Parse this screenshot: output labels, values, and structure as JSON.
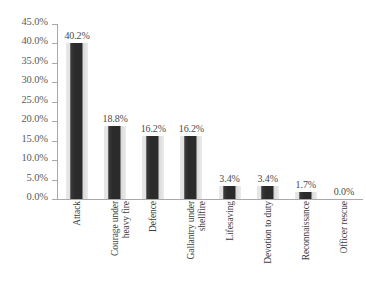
{
  "chart_data": {
    "type": "bar",
    "title": "",
    "subtitle": "",
    "xlabel": "",
    "ylabel": "",
    "categories": [
      "Attack",
      "Courage under\nheavy fire",
      "Defence",
      "Gallantry under\nshellfire",
      "Lifesaving",
      "Devotion to duty",
      "Reconnaissance",
      "Officer rescue"
    ],
    "values": [
      40.2,
      18.8,
      16.2,
      16.2,
      3.4,
      3.4,
      1.7,
      0.0
    ],
    "value_labels": [
      "40.2%",
      "18.8%",
      "16.2%",
      "16.2%",
      "3.4%",
      "3.4%",
      "1.7%",
      "0.0%"
    ],
    "ylim": [
      0,
      45
    ],
    "ytick_values": [
      0,
      5,
      10,
      15,
      20,
      25,
      30,
      35,
      40,
      45
    ],
    "ytick_labels": [
      "0.0%",
      "5.0%",
      "10.0%",
      "15.0%",
      "20.0%",
      "25.0%",
      "30.0%",
      "35.0%",
      "40.0%",
      "45.0%"
    ],
    "grid": false,
    "legend": false,
    "legend_position": "none",
    "bar_color": "#2b2b2b",
    "axis_color": "#a9a9a9",
    "tick_label_color": "#5b5b5b",
    "data_label_color": "#4a4a4a",
    "category_label_color": "#3d3d3d",
    "background_color": "#ffffff",
    "label_rotation": -90
  }
}
